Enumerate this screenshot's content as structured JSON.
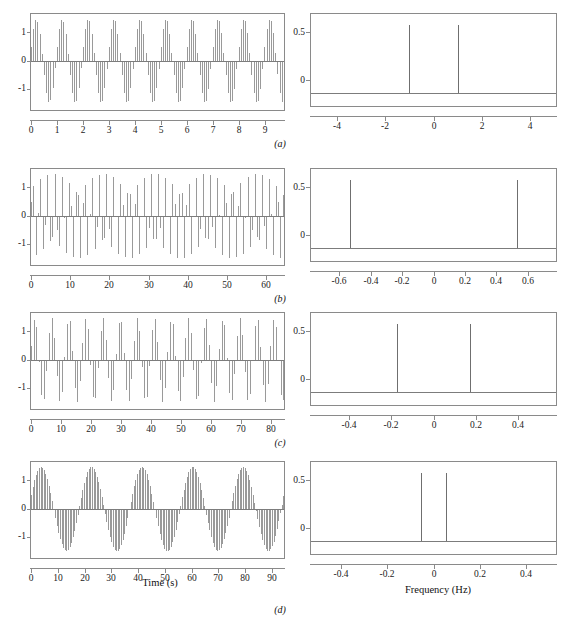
{
  "figure": {
    "caption_labels": [
      "(a)",
      "(b)",
      "(c)",
      "(d)"
    ],
    "xlabel_time": "Time (s)",
    "xlabel_freq": "Frequency (Hz)",
    "line_color": "#9a9a9a",
    "axis_color": "#8a8a8a"
  },
  "chart_data": [
    {
      "type": "line",
      "panel": "a",
      "subplot": "left",
      "title": "",
      "xlabel": "",
      "ylabel": "",
      "xlim": [
        0,
        9.75
      ],
      "ylim": [
        -1.15,
        1.15
      ],
      "xticks": [
        0,
        1,
        2,
        3,
        4,
        5,
        6,
        7,
        8,
        9
      ],
      "xticklabels": [
        "0",
        "1",
        "2",
        "3",
        "4",
        "5",
        "6",
        "7",
        "8",
        "9"
      ],
      "yticks": [
        -1,
        0,
        1
      ],
      "yticklabels": [
        "-1",
        "0",
        "1"
      ],
      "grid": false,
      "description": "Sampled sinusoid stem plot, signal frequency 1 Hz, sample interval 0.0833 s, 117 samples",
      "signal_frequency_hz": 1.0,
      "sample_interval_s": 0.0833,
      "n_samples": 117,
      "amplitude": 1.0
    },
    {
      "type": "line",
      "panel": "a",
      "subplot": "right",
      "title": "",
      "xlabel": "",
      "ylabel": "",
      "xlim": [
        -5.1,
        5.1
      ],
      "ylim": [
        -0.06,
        0.58
      ],
      "xticks": [
        -4,
        -2,
        0,
        2,
        4
      ],
      "xticklabels": [
        "-4",
        "-2",
        "0",
        "2",
        "4"
      ],
      "yticks": [
        0,
        0.5
      ],
      "yticklabels": [
        "0",
        "0.5"
      ],
      "grid": false,
      "description": "Magnitude spectrum, two impulses",
      "peaks": [
        {
          "x": -1.0,
          "y": 0.5
        },
        {
          "x": 1.0,
          "y": 0.5
        }
      ]
    },
    {
      "type": "line",
      "panel": "b",
      "subplot": "left",
      "title": "",
      "xlabel": "",
      "ylabel": "",
      "xlim": [
        0,
        64.5
      ],
      "ylim": [
        -1.15,
        1.15
      ],
      "xticks": [
        0,
        10,
        20,
        30,
        40,
        50,
        60
      ],
      "xticklabels": [
        "0",
        "10",
        "20",
        "30",
        "40",
        "50",
        "60"
      ],
      "yticks": [
        -1,
        0,
        1
      ],
      "yticklabels": [
        "-1",
        "0",
        "1"
      ],
      "grid": false,
      "description": "Aliased sampled sinusoid stem plot, apparent frequency 0.53 Hz",
      "signal_frequency_hz": 0.53,
      "sample_interval_s": 0.6,
      "n_samples": 108,
      "amplitude": 1.0
    },
    {
      "type": "line",
      "panel": "b",
      "subplot": "right",
      "title": "",
      "xlabel": "",
      "ylabel": "",
      "xlim": [
        -0.78,
        0.78
      ],
      "ylim": [
        -0.06,
        0.58
      ],
      "xticks": [
        -0.6,
        -0.4,
        -0.2,
        0,
        0.2,
        0.4,
        0.6
      ],
      "xticklabels": [
        "-0.6",
        "-0.4",
        "-0.2",
        "0",
        "0.2",
        "0.4",
        "0.6"
      ],
      "yticks": [
        0,
        0.5
      ],
      "yticklabels": [
        "0",
        "0.5"
      ],
      "grid": false,
      "description": "Magnitude spectrum, two impulses",
      "peaks": [
        {
          "x": -0.53,
          "y": 0.5
        },
        {
          "x": 0.53,
          "y": 0.5
        }
      ]
    },
    {
      "type": "line",
      "panel": "c",
      "subplot": "left",
      "title": "",
      "xlabel": "",
      "ylabel": "",
      "xlim": [
        0,
        84.5
      ],
      "ylim": [
        -1.15,
        1.15
      ],
      "xticks": [
        0,
        10,
        20,
        30,
        40,
        50,
        60,
        70,
        80
      ],
      "xticklabels": [
        "0",
        "10",
        "20",
        "30",
        "40",
        "50",
        "60",
        "70",
        "80"
      ],
      "yticks": [
        -1,
        0,
        1
      ],
      "yticklabels": [
        "-1",
        "0",
        "1"
      ],
      "grid": false,
      "description": "Aliased sampled sinusoid stem plot, apparent frequency 0.175 Hz",
      "signal_frequency_hz": 0.175,
      "sample_interval_s": 0.86,
      "n_samples": 99,
      "amplitude": 1.0
    },
    {
      "type": "line",
      "panel": "c",
      "subplot": "right",
      "title": "",
      "xlabel": "",
      "ylabel": "",
      "xlim": [
        -0.58,
        0.58
      ],
      "ylim": [
        -0.06,
        0.58
      ],
      "xticks": [
        -0.4,
        -0.2,
        0,
        0.2,
        0.4
      ],
      "xticklabels": [
        "-0.4",
        "-0.2",
        "0",
        "0.2",
        "0.4"
      ],
      "yticks": [
        0,
        0.5
      ],
      "yticklabels": [
        "0",
        "0.5"
      ],
      "grid": false,
      "description": "Magnitude spectrum, two impulses",
      "peaks": [
        {
          "x": -0.175,
          "y": 0.5
        },
        {
          "x": 0.175,
          "y": 0.5
        }
      ]
    },
    {
      "type": "line",
      "panel": "d",
      "subplot": "left",
      "title": "",
      "xlabel": "Time (s)",
      "ylabel": "",
      "xlim": [
        0,
        94.5
      ],
      "ylim": [
        -1.15,
        1.15
      ],
      "xticks": [
        0,
        10,
        20,
        30,
        40,
        50,
        60,
        70,
        80,
        90
      ],
      "xticklabels": [
        "0",
        "10",
        "20",
        "30",
        "40",
        "50",
        "60",
        "70",
        "80",
        "90"
      ],
      "yticks": [
        -1,
        0,
        1
      ],
      "yticklabels": [
        "-1",
        "0",
        "1"
      ],
      "grid": false,
      "description": "Aliased sampled sinusoid stem plot, apparent frequency 0.053 Hz",
      "signal_frequency_hz": 0.053,
      "sample_interval_s": 0.6,
      "n_samples": 158,
      "amplitude": 1.0
    },
    {
      "type": "line",
      "panel": "d",
      "subplot": "right",
      "title": "",
      "xlabel": "Frequency (Hz)",
      "ylabel": "",
      "xlim": [
        -0.53,
        0.53
      ],
      "ylim": [
        -0.06,
        0.58
      ],
      "xticks": [
        -0.4,
        -0.2,
        0,
        0.2,
        0.4
      ],
      "xticklabels": [
        "-0.4",
        "-0.2",
        "0",
        "0.2",
        "0.4"
      ],
      "yticks": [
        0,
        0.5
      ],
      "yticklabels": [
        "0",
        "0.5"
      ],
      "grid": false,
      "description": "Magnitude spectrum, two impulses",
      "peaks": [
        {
          "x": -0.053,
          "y": 0.5
        },
        {
          "x": 0.053,
          "y": 0.5
        }
      ]
    }
  ]
}
